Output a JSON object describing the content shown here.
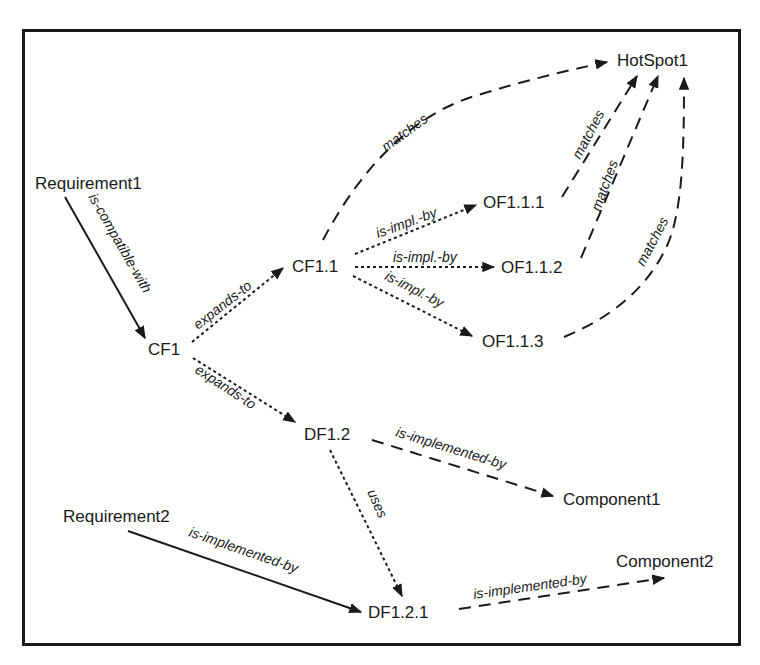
{
  "diagram": {
    "nodes": {
      "requirement1": "Requirement1",
      "requirement2": "Requirement2",
      "cf1": "CF1",
      "cf1_1": "CF1.1",
      "df1_2": "DF1.2",
      "df1_2_1": "DF1.2.1",
      "of1_1_1": "OF1.1.1",
      "of1_1_2": "OF1.1.2",
      "of1_1_3": "OF1.1.3",
      "hotspot1": "HotSpot1",
      "component1": "Component1",
      "component2": "Component2"
    },
    "edges": [
      {
        "from": "Requirement1",
        "to": "CF1",
        "label": "is-compatible-with",
        "style": "solid"
      },
      {
        "from": "CF1",
        "to": "CF1.1",
        "label": "expands-to",
        "style": "dotted"
      },
      {
        "from": "CF1",
        "to": "DF1.2",
        "label": "expands-to",
        "style": "dotted"
      },
      {
        "from": "CF1.1",
        "to": "OF1.1.1",
        "label": "is-impl.-by",
        "style": "dotted"
      },
      {
        "from": "CF1.1",
        "to": "OF1.1.2",
        "label": "is-impl.-by",
        "style": "dotted"
      },
      {
        "from": "CF1.1",
        "to": "OF1.1.3",
        "label": "is-impl.-by",
        "style": "dotted"
      },
      {
        "from": "CF1.1",
        "to": "HotSpot1",
        "label": "matches",
        "style": "dashed"
      },
      {
        "from": "OF1.1.1",
        "to": "HotSpot1",
        "label": "matches",
        "style": "dashed"
      },
      {
        "from": "OF1.1.2",
        "to": "HotSpot1",
        "label": "matches",
        "style": "dashed"
      },
      {
        "from": "OF1.1.3",
        "to": "HotSpot1",
        "label": "matches",
        "style": "dashed"
      },
      {
        "from": "DF1.2",
        "to": "Component1",
        "label": "is-implemented-by",
        "style": "dashed"
      },
      {
        "from": "DF1.2",
        "to": "DF1.2.1",
        "label": "uses",
        "style": "dotted"
      },
      {
        "from": "Requirement2",
        "to": "DF1.2.1",
        "label": "is-implemented-by",
        "style": "solid"
      },
      {
        "from": "DF1.2.1",
        "to": "Component2",
        "label": "is-implemented-by",
        "style": "dashed"
      }
    ],
    "labels": {
      "is_compatible_with": "is-compatible-with",
      "expands_to": "expands-to",
      "is_impl_by": "is-impl.-by",
      "matches": "matches",
      "is_implemented_by": "is-implemented-by",
      "uses": "uses"
    },
    "colors": {
      "line": "#1a1a1a",
      "background": "#ffffff"
    }
  }
}
